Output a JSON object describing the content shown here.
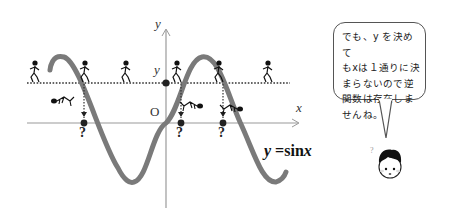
{
  "graph": {
    "axis_labels": {
      "x": "x",
      "y": "y",
      "origin": "O",
      "level": "y"
    },
    "equation": {
      "lhs": "y",
      "rhs_func": "sin",
      "rhs_var": "x",
      "eq": "="
    },
    "question_mark": "?",
    "curve_color": "#7a7a7a",
    "axis_color": "#9a9a9a"
  },
  "speech_bubble": {
    "text": "でも、y を決めて\nもxは１通りに決\nまらないので逆\n関数は存在しま\nせんね。"
  },
  "character": {
    "thought_mark": "?"
  }
}
